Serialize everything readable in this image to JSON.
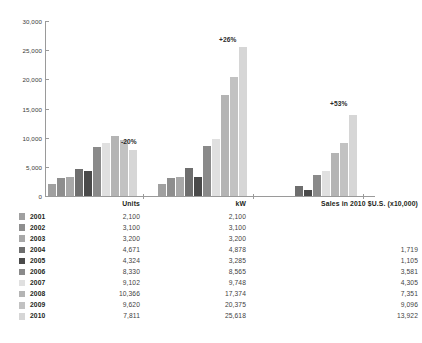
{
  "chart_data": {
    "type": "bar",
    "title": "",
    "xlabel": "",
    "ylabel": "",
    "ylim": [
      0,
      30000
    ],
    "grid": false,
    "legend_position": "below-as-table",
    "categories": [
      "Units",
      "kW",
      "Sales in 2010 $U.S. (x10,000)"
    ],
    "series": [
      {
        "name": "2001",
        "color": "#a0a0a0",
        "values": [
          2100,
          2100,
          null
        ]
      },
      {
        "name": "2002",
        "color": "#8e8e8e",
        "values": [
          3100,
          3100,
          null
        ]
      },
      {
        "name": "2003",
        "color": "#a8a8a8",
        "values": [
          3200,
          3200,
          null
        ]
      },
      {
        "name": "2004",
        "color": "#6e6e6e",
        "values": [
          4671,
          4878,
          1719
        ]
      },
      {
        "name": "2005",
        "color": "#4a4a4a",
        "values": [
          4324,
          3285,
          1105
        ]
      },
      {
        "name": "2006",
        "color": "#8a8a8a",
        "values": [
          8330,
          8565,
          3581
        ]
      },
      {
        "name": "2007",
        "color": "#e0e0e0",
        "values": [
          9102,
          9748,
          4305
        ]
      },
      {
        "name": "2008",
        "color": "#b4b4b4",
        "values": [
          10366,
          17374,
          7351
        ]
      },
      {
        "name": "2009",
        "color": "#c2c2c2",
        "values": [
          9620,
          20375,
          9096
        ]
      },
      {
        "name": "2010",
        "color": "#d6d6d6",
        "values": [
          7811,
          25618,
          13922
        ]
      }
    ],
    "yticks": [
      "0",
      "5,000",
      "10,000",
      "15,000",
      "20,000",
      "25,000",
      "30,000"
    ],
    "ytick_values": [
      0,
      5000,
      10000,
      15000,
      20000,
      25000,
      30000
    ],
    "annotations": [
      {
        "text": "-20%",
        "group": "Units"
      },
      {
        "text": "+26%",
        "group": "kW"
      },
      {
        "text": "+53%",
        "group": "Sales in 2010 $U.S. (x10,000)"
      }
    ]
  },
  "table": {
    "headers": {
      "swatch": "",
      "year": "",
      "units": "Units",
      "kw": "kW",
      "sales": "Sales in 2010 $U.S. (x10,000)"
    },
    "rows": [
      {
        "year": "2001",
        "color": "#a0a0a0",
        "units": "2,100",
        "kw": "2,100",
        "sales": ""
      },
      {
        "year": "2002",
        "color": "#8e8e8e",
        "units": "3,100",
        "kw": "3,100",
        "sales": ""
      },
      {
        "year": "2003",
        "color": "#a8a8a8",
        "units": "3,200",
        "kw": "3,200",
        "sales": ""
      },
      {
        "year": "2004",
        "color": "#6e6e6e",
        "units": "4,671",
        "kw": "4,878",
        "sales": "1,719"
      },
      {
        "year": "2005",
        "color": "#4a4a4a",
        "units": "4,324",
        "kw": "3,285",
        "sales": "1,105"
      },
      {
        "year": "2006",
        "color": "#8a8a8a",
        "units": "8,330",
        "kw": "8,565",
        "sales": "3,581"
      },
      {
        "year": "2007",
        "color": "#e0e0e0",
        "units": "9,102",
        "kw": "9,748",
        "sales": "4,305"
      },
      {
        "year": "2008",
        "color": "#b4b4b4",
        "units": "10,366",
        "kw": "17,374",
        "sales": "7,351"
      },
      {
        "year": "2009",
        "color": "#c2c2c2",
        "units": "9,620",
        "kw": "20,375",
        "sales": "9,096"
      },
      {
        "year": "2010",
        "color": "#d6d6d6",
        "units": "7,811",
        "kw": "25,618",
        "sales": "13,922"
      }
    ]
  }
}
